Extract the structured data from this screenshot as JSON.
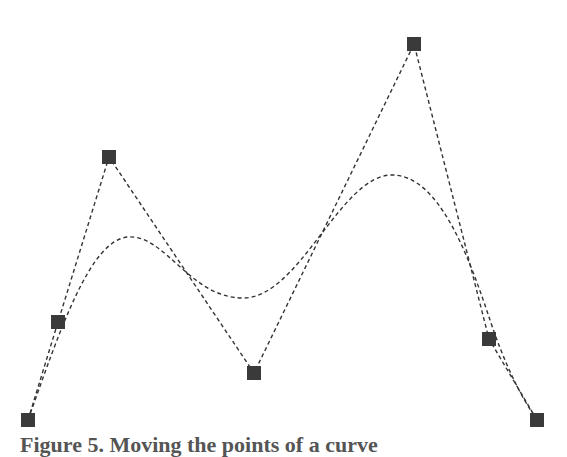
{
  "figure": {
    "caption": "Figure 5. Moving the points of a curve",
    "control_points": [
      {
        "x": 28,
        "y": 420
      },
      {
        "x": 58,
        "y": 322
      },
      {
        "x": 109,
        "y": 157
      },
      {
        "x": 254,
        "y": 373
      },
      {
        "x": 414,
        "y": 44
      },
      {
        "x": 489,
        "y": 339
      },
      {
        "x": 537,
        "y": 420
      }
    ],
    "curve_path": "M 28 420 C 60 330, 90 240, 128 237 C 165 234, 190 298, 243 298 C 300 298, 340 175, 392 175 C 440 175, 470 260, 490 320 C 505 365, 520 395, 537 420",
    "colors": {
      "point_fill": "#3a3a3a",
      "line": "#333333",
      "background": "#ffffff"
    },
    "point_size": 14
  }
}
